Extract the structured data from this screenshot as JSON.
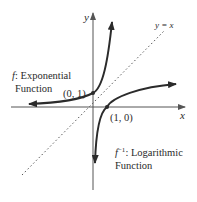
{
  "diagram": {
    "axes": {
      "x_label": "x",
      "y_label": "y"
    },
    "reference_line": {
      "label": "y = x",
      "style": "dotted"
    },
    "curves": [
      {
        "id": "exponential",
        "label_symbol": "f",
        "label_line1_rest": ": Exponential",
        "label_line2": "Function",
        "point_label": "(0, 1)"
      },
      {
        "id": "logarithmic",
        "label_symbol": "f",
        "label_superscript": "−1",
        "label_line1_rest": ": Logarithmic",
        "label_line2": "Function",
        "point_label": "(1, 0)"
      }
    ],
    "colors": {
      "axis": "#555555",
      "curve": "#2b2b2b",
      "reference": "#555555",
      "text": "#2a2a2a"
    }
  }
}
